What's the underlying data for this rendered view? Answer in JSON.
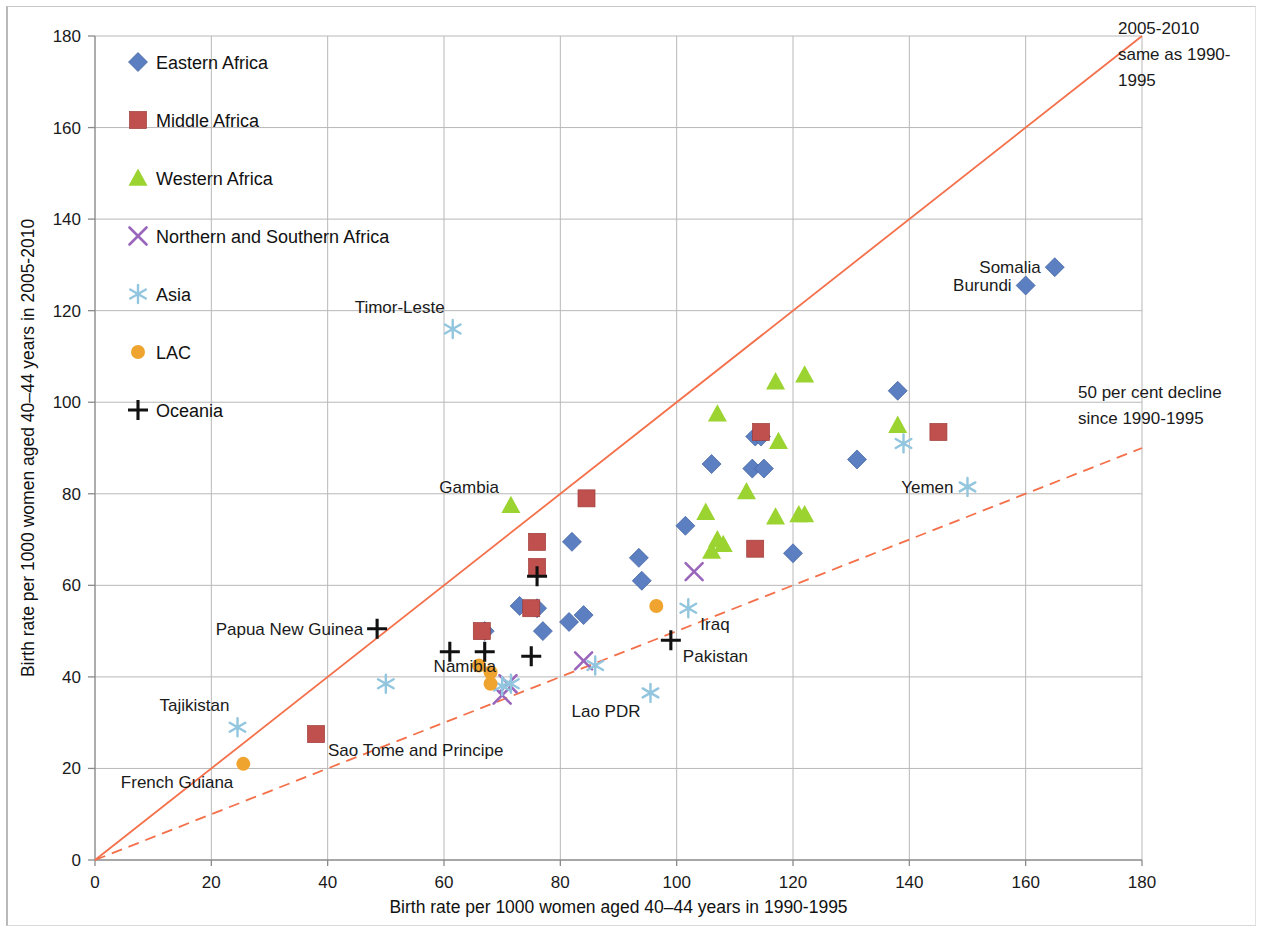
{
  "chart_data": {
    "type": "scatter",
    "title": "",
    "xlabel": "Birth rate per 1000 women aged 40–44 years in 1990-1995",
    "ylabel": "Birth rate per 1000 women aged 40–44 years in 2005-2010",
    "xlim": [
      0,
      180
    ],
    "ylim": [
      0,
      180
    ],
    "xticks": [
      0,
      20,
      40,
      60,
      80,
      100,
      120,
      140,
      160,
      180
    ],
    "yticks": [
      0,
      20,
      40,
      60,
      80,
      100,
      120,
      140,
      160,
      180
    ],
    "grid": true,
    "legend_position": "upper-left-inside",
    "colors": {
      "eastern_africa": "#5B7FC0",
      "middle_africa": "#C0504D",
      "western_africa": "#9BD430",
      "northern_southern_africa": "#9966BB",
      "asia": "#92C5DE",
      "lac": "#F0A430",
      "oceania": "#111111",
      "reference_line": "#F4704A"
    },
    "reference_lines": [
      {
        "name": "parity-line",
        "label": "2005-2010 same as 1990-1995",
        "style": "solid",
        "from": [
          0,
          0
        ],
        "to": [
          180,
          180
        ]
      },
      {
        "name": "half-decline-line",
        "label": "50 per cent decline since 1990-1995",
        "style": "dashed",
        "from": [
          0,
          0
        ],
        "to": [
          180,
          90
        ]
      }
    ],
    "annotations": [
      {
        "name": "parity-annotation",
        "lines": [
          "2005-2010",
          " same as 1990-",
          "1995"
        ]
      },
      {
        "name": "decline-annotation",
        "lines": [
          "50 per cent decline",
          "since 1990-1995"
        ]
      }
    ],
    "legend": [
      {
        "label": "Eastern Africa",
        "marker": "diamond",
        "color": "#5B7FC0"
      },
      {
        "label": "Middle Africa",
        "marker": "square",
        "color": "#C0504D"
      },
      {
        "label": "Western Africa",
        "marker": "triangle",
        "color": "#9BD430"
      },
      {
        "label": "Northern and Southern Africa",
        "marker": "x",
        "color": "#9966BB"
      },
      {
        "label": "Asia",
        "marker": "asterisk",
        "color": "#92C5DE"
      },
      {
        "label": "LAC",
        "marker": "circle",
        "color": "#F0A430"
      },
      {
        "label": "Oceania",
        "marker": "plus",
        "color": "#111111"
      }
    ],
    "series": [
      {
        "name": "Eastern Africa",
        "marker": "diamond",
        "color": "#5B7FC0",
        "points": [
          {
            "x": 165,
            "y": 129.5,
            "label": "Somalia",
            "label_pos": "left"
          },
          {
            "x": 160,
            "y": 125.5,
            "label": "Burundi",
            "label_pos": "left"
          },
          {
            "x": 138,
            "y": 102.5
          },
          {
            "x": 131,
            "y": 87.5
          },
          {
            "x": 113.5,
            "y": 92.5
          },
          {
            "x": 114.5,
            "y": 92.5
          },
          {
            "x": 106,
            "y": 86.5
          },
          {
            "x": 113,
            "y": 85.5
          },
          {
            "x": 115,
            "y": 85.5
          },
          {
            "x": 120,
            "y": 67
          },
          {
            "x": 101.5,
            "y": 73
          },
          {
            "x": 93.5,
            "y": 66
          },
          {
            "x": 94,
            "y": 61
          },
          {
            "x": 82,
            "y": 69.5
          },
          {
            "x": 84,
            "y": 53.5
          },
          {
            "x": 81.5,
            "y": 52
          },
          {
            "x": 73,
            "y": 55.5
          },
          {
            "x": 76,
            "y": 55
          },
          {
            "x": 77,
            "y": 50
          },
          {
            "x": 67,
            "y": 50
          }
        ]
      },
      {
        "name": "Middle Africa",
        "marker": "square",
        "color": "#C0504D",
        "points": [
          {
            "x": 145,
            "y": 93.5
          },
          {
            "x": 114.5,
            "y": 93.5
          },
          {
            "x": 113.5,
            "y": 68
          },
          {
            "x": 84.5,
            "y": 79
          },
          {
            "x": 76,
            "y": 69.5
          },
          {
            "x": 76,
            "y": 64
          },
          {
            "x": 75,
            "y": 55
          },
          {
            "x": 66.5,
            "y": 50
          },
          {
            "x": 38,
            "y": 27.5,
            "label": "Sao Tome and Principe",
            "label_pos": "below-right"
          }
        ]
      },
      {
        "name": "Western Africa",
        "marker": "triangle",
        "color": "#9BD430",
        "points": [
          {
            "x": 122,
            "y": 106
          },
          {
            "x": 117,
            "y": 104.5
          },
          {
            "x": 107,
            "y": 97.5
          },
          {
            "x": 138,
            "y": 95
          },
          {
            "x": 117.5,
            "y": 91.5
          },
          {
            "x": 105,
            "y": 76
          },
          {
            "x": 117,
            "y": 75
          },
          {
            "x": 121,
            "y": 75.5
          },
          {
            "x": 122,
            "y": 75.5
          },
          {
            "x": 112,
            "y": 80.5
          },
          {
            "x": 107,
            "y": 70
          },
          {
            "x": 108,
            "y": 69
          },
          {
            "x": 106,
            "y": 67.5
          },
          {
            "x": 71.5,
            "y": 77.5,
            "label": "Gambia",
            "label_pos": "left-above"
          }
        ]
      },
      {
        "name": "Northern and Southern Africa",
        "marker": "x",
        "color": "#9966BB",
        "points": [
          {
            "x": 103,
            "y": 63
          },
          {
            "x": 84,
            "y": 43.5
          },
          {
            "x": 71,
            "y": 38.5,
            "label": "Namibia",
            "label_pos": "left-above"
          },
          {
            "x": 70,
            "y": 36
          }
        ]
      },
      {
        "name": "Asia",
        "marker": "asterisk",
        "color": "#92C5DE",
        "points": [
          {
            "x": 61.5,
            "y": 116,
            "label": "Timor-Leste",
            "label_pos": "above-left"
          },
          {
            "x": 150,
            "y": 81.5,
            "label": "Yemen",
            "label_pos": "left"
          },
          {
            "x": 139,
            "y": 91
          },
          {
            "x": 102,
            "y": 55,
            "label": "Iraq",
            "label_pos": "below-right"
          },
          {
            "x": 95.5,
            "y": 36.5,
            "label": "Lao PDR",
            "label_pos": "below-left"
          },
          {
            "x": 86,
            "y": 42.5
          },
          {
            "x": 71.5,
            "y": 38.5
          },
          {
            "x": 70,
            "y": 38
          },
          {
            "x": 50,
            "y": 38.5
          },
          {
            "x": 24.5,
            "y": 29,
            "label": "Tajikistan",
            "label_pos": "above-left"
          }
        ]
      },
      {
        "name": "LAC",
        "marker": "circle",
        "color": "#F0A430",
        "points": [
          {
            "x": 96.5,
            "y": 55.5
          },
          {
            "x": 66,
            "y": 42.5
          },
          {
            "x": 68,
            "y": 41
          },
          {
            "x": 68,
            "y": 38.5
          },
          {
            "x": 25.5,
            "y": 21,
            "label": "French Guiana",
            "label_pos": "below-left"
          }
        ]
      },
      {
        "name": "Oceania",
        "marker": "plus",
        "color": "#111111",
        "points": [
          {
            "x": 99,
            "y": 48,
            "label": "Pakistan",
            "label_pos": "below-right"
          },
          {
            "x": 76,
            "y": 62
          },
          {
            "x": 75,
            "y": 44.5
          },
          {
            "x": 67,
            "y": 45.5
          },
          {
            "x": 61,
            "y": 45.5
          },
          {
            "x": 48.5,
            "y": 50.5,
            "label": "Papua New Guinea",
            "label_pos": "left"
          }
        ]
      }
    ]
  }
}
